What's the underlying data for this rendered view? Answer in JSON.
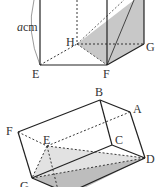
{
  "figure_top": {
    "dimension_label_var": "a",
    "dimension_label_unit": "cm",
    "vertices": {
      "E": "E",
      "F": "F",
      "G": "G",
      "H": "H"
    },
    "shade_color": "#c8c8c8"
  },
  "figure_bottom": {
    "vertices": {
      "A": "A",
      "B": "B",
      "C": "C",
      "D": "D",
      "E": "E",
      "F": "F",
      "G": "G"
    },
    "shade_light": "#e2e2e2",
    "shade_dark": "#bdbdbd"
  }
}
